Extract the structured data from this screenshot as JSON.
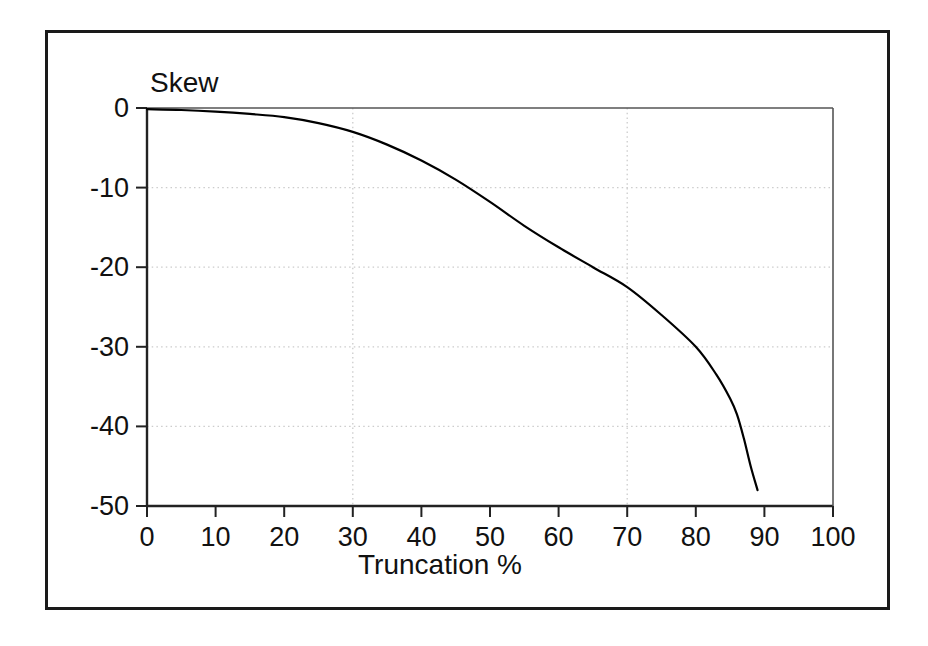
{
  "chart_data": {
    "type": "line",
    "title": "",
    "xlabel": "Truncation %",
    "ylabel": "Skew",
    "xlim": [
      0,
      100
    ],
    "ylim": [
      -50,
      0
    ],
    "xticks": [
      0,
      10,
      20,
      30,
      40,
      50,
      60,
      70,
      80,
      90,
      100
    ],
    "xticklabels": [
      "0",
      "10",
      "20",
      "30",
      "40",
      "50",
      "60",
      "70",
      "80",
      "90",
      "100"
    ],
    "yticks": [
      0,
      -10,
      -20,
      -30,
      -40,
      -50
    ],
    "yticklabels": [
      "0",
      "-10",
      "-20",
      "-30",
      "-40",
      "-50"
    ],
    "grid": {
      "enabled": true,
      "style": "dotted",
      "color": "#cccccc",
      "vertical_at": [
        30,
        70
      ],
      "horizontal_at": [
        -10,
        -20,
        -30,
        -40
      ]
    },
    "legend": null,
    "line_color": "#000000",
    "line_width": 2.2,
    "series": [
      {
        "name": "Skew vs Truncation",
        "x": [
          0,
          2,
          5,
          8,
          10,
          12,
          15,
          18,
          20,
          22,
          25,
          28,
          30,
          32,
          35,
          38,
          40,
          42,
          45,
          48,
          50,
          52,
          54,
          56,
          58,
          60,
          62,
          64,
          66,
          68,
          70,
          72,
          74,
          76,
          78,
          80,
          81,
          82,
          83,
          84,
          85,
          86,
          87,
          88,
          89
        ],
        "y": [
          -0.15,
          -0.2,
          -0.3,
          -0.4,
          -0.5,
          -0.6,
          -0.8,
          -1.0,
          -1.2,
          -1.5,
          -2.0,
          -2.6,
          -3.1,
          -3.7,
          -4.7,
          -5.8,
          -6.7,
          -7.6,
          -9.1,
          -10.8,
          -12.0,
          -13.3,
          -14.6,
          -15.9,
          -17.3,
          -18.0,
          -19.0,
          -20.0,
          -21.4,
          -22.8,
          -20.0,
          -22.5,
          -25.0,
          -27.2,
          -29.0,
          -30.2,
          -31.5,
          -33.0,
          -34.6,
          -36.3,
          -38.2,
          -40.3,
          -42.6,
          -45.2,
          -47.9
        ]
      }
    ],
    "curve_path_points": [
      [
        0,
        -0.15
      ],
      [
        5,
        -0.25
      ],
      [
        10,
        -0.45
      ],
      [
        15,
        -0.75
      ],
      [
        20,
        -1.15
      ],
      [
        25,
        -1.9
      ],
      [
        30,
        -3.0
      ],
      [
        35,
        -4.6
      ],
      [
        40,
        -6.6
      ],
      [
        45,
        -9.0
      ],
      [
        50,
        -11.8
      ],
      [
        55,
        -14.8
      ],
      [
        60,
        -17.5
      ],
      [
        65,
        -20.0
      ],
      [
        70,
        -22.5
      ],
      [
        75,
        -26.0
      ],
      [
        80,
        -30.0
      ],
      [
        83,
        -33.5
      ],
      [
        85,
        -36.5
      ],
      [
        86,
        -38.5
      ],
      [
        87,
        -41.5
      ],
      [
        88,
        -45.0
      ],
      [
        89,
        -48.0
      ]
    ]
  },
  "axis_titles": {
    "y": "Skew",
    "x": "Truncation %"
  }
}
